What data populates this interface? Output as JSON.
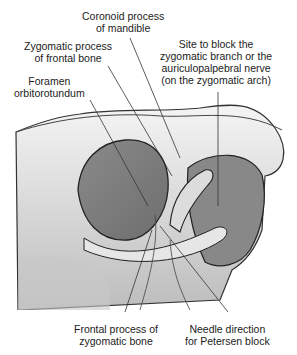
{
  "diagram": {
    "labels": [
      {
        "id": "coronoid",
        "lines": [
          "Coronoid process",
          "of mandible"
        ]
      },
      {
        "id": "zygomatic_frontal",
        "lines": [
          "Zygomatic process",
          "of frontal bone"
        ]
      },
      {
        "id": "foramen",
        "lines": [
          "Foramen",
          "orbitorotundum"
        ]
      },
      {
        "id": "site_block",
        "lines": [
          "Site to block the",
          "zygomatic branch or the",
          "auriculopalpebral nerve",
          "(on the zygomatic arch)"
        ]
      },
      {
        "id": "frontal_process",
        "lines": [
          "Frontal process of",
          "zygomatic bone"
        ]
      },
      {
        "id": "needle",
        "lines": [
          "Needle direction",
          "for Petersen block"
        ]
      }
    ]
  }
}
